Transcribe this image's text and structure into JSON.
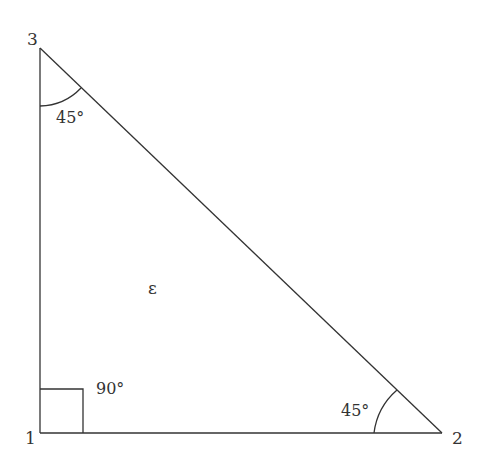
{
  "diagram": {
    "type": "right triangle",
    "vertices": [
      {
        "id": "1",
        "label": "1",
        "x": 40,
        "y": 433
      },
      {
        "id": "2",
        "label": "2",
        "x": 442,
        "y": 433
      },
      {
        "id": "3",
        "label": "3",
        "x": 39,
        "y": 48
      }
    ],
    "angles": {
      "vertex1": "90°",
      "vertex2": "45°",
      "vertex3": "45°"
    },
    "interior_label": "ε",
    "colors": {
      "stroke": "#333333",
      "background": "#ffffff"
    }
  }
}
